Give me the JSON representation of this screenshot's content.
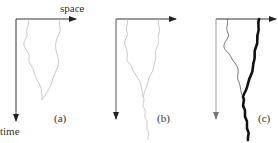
{
  "figure": {
    "axis_labels": {
      "x": "space",
      "y": "time"
    },
    "panels": [
      {
        "id": "a",
        "label": "(a)"
      },
      {
        "id": "b",
        "label": "(b)"
      },
      {
        "id": "c",
        "label": "(c)"
      }
    ]
  }
}
